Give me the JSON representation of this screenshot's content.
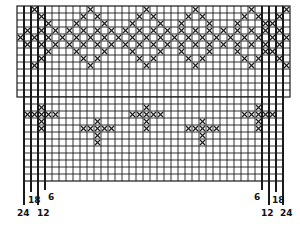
{
  "diagram": {
    "type": "knitting-chart",
    "cell_size": 7,
    "line_color": "#1a1a1a",
    "mark_color": "#1a1a1a",
    "upper_grid": {
      "x": 17,
      "y": 6,
      "cols": 39,
      "rows": 13
    },
    "lower_grid": {
      "x": 24,
      "y": 97,
      "cols": 37,
      "rows": 12
    },
    "bold_columns_left": [
      0,
      2,
      4,
      6
    ],
    "top_band": {
      "diagonal_rows": [
        0,
        1,
        2,
        3
      ],
      "dense_rows": [
        4,
        5
      ],
      "lower_diagonal_rows": [
        6,
        7,
        8,
        9
      ]
    },
    "marks_upper": [
      [
        0,
        2
      ],
      [
        0,
        10
      ],
      [
        0,
        18
      ],
      [
        0,
        25
      ],
      [
        0,
        33
      ],
      [
        0,
        38
      ],
      [
        1,
        3
      ],
      [
        1,
        9
      ],
      [
        1,
        11
      ],
      [
        1,
        17
      ],
      [
        1,
        19
      ],
      [
        1,
        24
      ],
      [
        1,
        26
      ],
      [
        1,
        32
      ],
      [
        1,
        34
      ],
      [
        1,
        37
      ],
      [
        2,
        4
      ],
      [
        2,
        8
      ],
      [
        2,
        12
      ],
      [
        2,
        16
      ],
      [
        2,
        20
      ],
      [
        2,
        23
      ],
      [
        2,
        27
      ],
      [
        2,
        31
      ],
      [
        2,
        35
      ],
      [
        2,
        36
      ],
      [
        3,
        1
      ],
      [
        3,
        3
      ],
      [
        3,
        5
      ],
      [
        3,
        7
      ],
      [
        3,
        9
      ],
      [
        3,
        11
      ],
      [
        3,
        13
      ],
      [
        3,
        15
      ],
      [
        3,
        17
      ],
      [
        3,
        19
      ],
      [
        3,
        21
      ],
      [
        3,
        23
      ],
      [
        3,
        25
      ],
      [
        3,
        27
      ],
      [
        3,
        29
      ],
      [
        3,
        31
      ],
      [
        3,
        33
      ],
      [
        3,
        35
      ],
      [
        3,
        37
      ],
      [
        4,
        0
      ],
      [
        4,
        2
      ],
      [
        4,
        4
      ],
      [
        4,
        6
      ],
      [
        4,
        8
      ],
      [
        4,
        10
      ],
      [
        4,
        12
      ],
      [
        4,
        14
      ],
      [
        4,
        16
      ],
      [
        4,
        18
      ],
      [
        4,
        20
      ],
      [
        4,
        22
      ],
      [
        4,
        24
      ],
      [
        4,
        26
      ],
      [
        4,
        28
      ],
      [
        4,
        30
      ],
      [
        4,
        32
      ],
      [
        4,
        34
      ],
      [
        4,
        36
      ],
      [
        4,
        38
      ],
      [
        5,
        1
      ],
      [
        5,
        3
      ],
      [
        5,
        5
      ],
      [
        5,
        7
      ],
      [
        5,
        9
      ],
      [
        5,
        11
      ],
      [
        5,
        13
      ],
      [
        5,
        15
      ],
      [
        5,
        17
      ],
      [
        5,
        19
      ],
      [
        5,
        21
      ],
      [
        5,
        23
      ],
      [
        5,
        25
      ],
      [
        5,
        27
      ],
      [
        5,
        29
      ],
      [
        5,
        31
      ],
      [
        5,
        33
      ],
      [
        5,
        35
      ],
      [
        5,
        37
      ],
      [
        6,
        4
      ],
      [
        6,
        8
      ],
      [
        6,
        12
      ],
      [
        6,
        16
      ],
      [
        6,
        20
      ],
      [
        6,
        23
      ],
      [
        6,
        27
      ],
      [
        6,
        31
      ],
      [
        6,
        35
      ],
      [
        6,
        36
      ],
      [
        7,
        3
      ],
      [
        7,
        9
      ],
      [
        7,
        11
      ],
      [
        7,
        17
      ],
      [
        7,
        19
      ],
      [
        7,
        24
      ],
      [
        7,
        26
      ],
      [
        7,
        32
      ],
      [
        7,
        34
      ],
      [
        7,
        37
      ],
      [
        8,
        2
      ],
      [
        8,
        10
      ],
      [
        8,
        18
      ],
      [
        8,
        25
      ],
      [
        8,
        33
      ],
      [
        8,
        38
      ]
    ],
    "marks_lower": [
      [
        1,
        2
      ],
      [
        2,
        1
      ],
      [
        2,
        3
      ],
      [
        3,
        2
      ],
      [
        2,
        2
      ],
      [
        4,
        2
      ],
      [
        2,
        0
      ],
      [
        2,
        4
      ],
      [
        1,
        17
      ],
      [
        2,
        16
      ],
      [
        2,
        18
      ],
      [
        3,
        17
      ],
      [
        2,
        17
      ],
      [
        4,
        17
      ],
      [
        2,
        15
      ],
      [
        2,
        19
      ],
      [
        1,
        33
      ],
      [
        2,
        32
      ],
      [
        2,
        34
      ],
      [
        3,
        33
      ],
      [
        2,
        33
      ],
      [
        4,
        33
      ],
      [
        2,
        31
      ],
      [
        2,
        35
      ],
      [
        3,
        10
      ],
      [
        4,
        9
      ],
      [
        4,
        11
      ],
      [
        5,
        10
      ],
      [
        4,
        10
      ],
      [
        6,
        10
      ],
      [
        4,
        8
      ],
      [
        4,
        12
      ],
      [
        3,
        25
      ],
      [
        4,
        24
      ],
      [
        4,
        26
      ],
      [
        5,
        25
      ],
      [
        4,
        25
      ],
      [
        6,
        25
      ],
      [
        4,
        23
      ],
      [
        4,
        27
      ]
    ],
    "size_labels_left": [
      {
        "text": "24",
        "x": 17,
        "y": 209
      },
      {
        "text": "18",
        "x": 28,
        "y": 196
      },
      {
        "text": "12",
        "x": 37,
        "y": 209
      },
      {
        "text": "6",
        "x": 48,
        "y": 193
      }
    ],
    "size_labels_right": [
      {
        "text": "6",
        "x": 254,
        "y": 193
      },
      {
        "text": "12",
        "x": 261,
        "y": 209
      },
      {
        "text": "18",
        "x": 272,
        "y": 196
      },
      {
        "text": "24",
        "x": 280,
        "y": 209
      }
    ],
    "size_lines_left": [
      {
        "x": 24,
        "y2": 205
      },
      {
        "x": 31,
        "y2": 192
      },
      {
        "x": 38,
        "y2": 205
      },
      {
        "x": 45,
        "y2": 190
      }
    ],
    "size_lines_right": [
      {
        "x": 262,
        "y2": 190
      },
      {
        "x": 269,
        "y2": 205
      },
      {
        "x": 276,
        "y2": 192
      },
      {
        "x": 283,
        "y2": 205
      }
    ]
  }
}
